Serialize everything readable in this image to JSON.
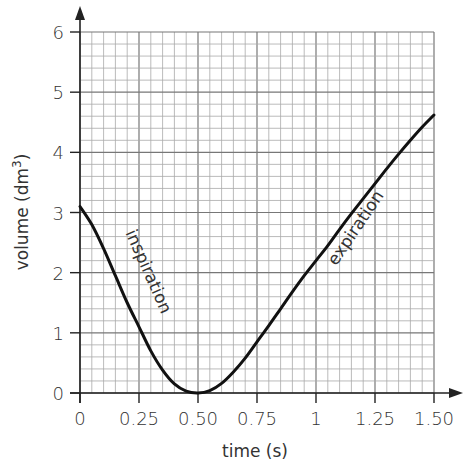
{
  "chart_data": {
    "type": "line",
    "title": "",
    "xlabel": "time (s)",
    "ylabel": "volume (dm³)",
    "ylabel_base": "volume (dm",
    "ylabel_sup": "3",
    "ylabel_close": ")",
    "xlim": [
      0,
      1.5
    ],
    "ylim": [
      0,
      6
    ],
    "x_ticks": [
      0,
      0.25,
      0.5,
      0.75,
      1,
      1.25,
      1.5
    ],
    "x_tick_labels": [
      "0",
      "0.25",
      "0.50",
      "0.75",
      "1",
      "1.25",
      "1.50"
    ],
    "y_ticks": [
      0,
      1,
      2,
      3,
      4,
      5,
      6
    ],
    "y_tick_labels": [
      "0",
      "1",
      "2",
      "3",
      "4",
      "5",
      "6"
    ],
    "grid": true,
    "grid_minor_x_step": 0.05,
    "grid_minor_y_step": 0.2,
    "series": [
      {
        "name": "lung volume",
        "x": [
          0,
          0.05,
          0.1,
          0.15,
          0.2,
          0.25,
          0.3,
          0.35,
          0.4,
          0.45,
          0.5,
          0.55,
          0.6,
          0.65,
          0.7,
          0.75,
          0.8,
          0.85,
          0.9,
          0.95,
          1.0,
          1.05,
          1.1,
          1.15,
          1.2,
          1.25,
          1.3,
          1.35,
          1.4,
          1.45,
          1.5
        ],
        "values": [
          3.1,
          2.8,
          2.4,
          1.95,
          1.5,
          1.1,
          0.7,
          0.38,
          0.15,
          0.03,
          0.0,
          0.04,
          0.16,
          0.35,
          0.58,
          0.85,
          1.12,
          1.4,
          1.68,
          1.95,
          2.2,
          2.45,
          2.72,
          2.98,
          3.23,
          3.48,
          3.73,
          3.97,
          4.2,
          4.42,
          4.62
        ]
      }
    ],
    "annotations": [
      {
        "text": "inspiration",
        "x": 0.2,
        "y": 2.0,
        "rotation": 66
      },
      {
        "text": "expiration",
        "x": 1.12,
        "y": 3.1,
        "rotation": -56
      }
    ]
  }
}
